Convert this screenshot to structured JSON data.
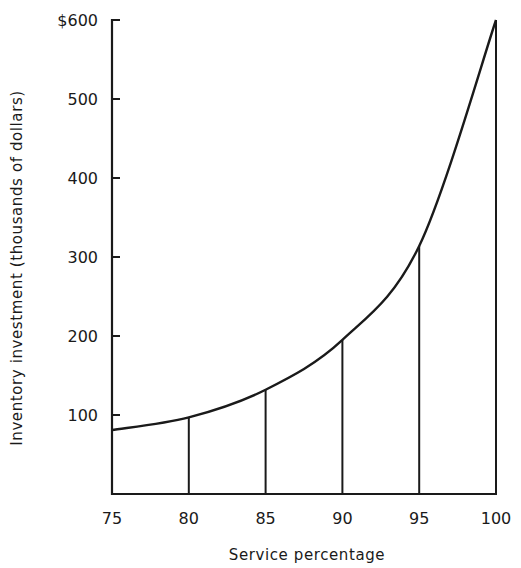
{
  "chart_data": {
    "type": "line",
    "title": "",
    "xlabel": "Service percentage",
    "ylabel": "Inventory investment (thousands of dollars)",
    "x": [
      75,
      80,
      85,
      90,
      95,
      100
    ],
    "series": [
      {
        "name": "Inventory investment",
        "values": [
          81,
          97,
          132,
          195,
          314,
          600
        ]
      }
    ],
    "xlim": [
      75,
      100
    ],
    "ylim": [
      0,
      600
    ],
    "x_ticks": [
      75,
      80,
      85,
      90,
      95,
      100
    ],
    "x_tick_labels": [
      "75",
      "80",
      "85",
      "90",
      "95",
      "100"
    ],
    "y_ticks": [
      100,
      200,
      300,
      400,
      500,
      600
    ],
    "y_tick_labels": [
      "100",
      "200",
      "300",
      "400",
      "500",
      "$600"
    ],
    "drop_lines_at_x": [
      80,
      85,
      90,
      95,
      100
    ],
    "grid": false,
    "legend": "none",
    "line_color": "#1a1a1a",
    "background_color": "#ffffff"
  }
}
